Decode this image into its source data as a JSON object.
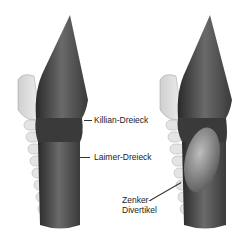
{
  "diagram": {
    "panels": [
      {
        "id": "left",
        "description": "Pharynx/esophagus posterior view, normal"
      },
      {
        "id": "right",
        "description": "Pharynx/esophagus posterior view with Zenker diverticulum"
      }
    ],
    "labels": {
      "killian": "Killian-Dreieck",
      "laimer": "Laimer-Dreieck",
      "zenker_line1": "Zenker-",
      "zenker_line2": "Divertikel"
    }
  }
}
